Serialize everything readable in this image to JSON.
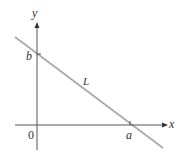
{
  "diagram": {
    "type": "coordinate-plane-line",
    "axes": {
      "x_label": "x",
      "y_label": "y",
      "origin_label": "0"
    },
    "line": {
      "label": "L",
      "x_intercept_label": "a",
      "y_intercept_label": "b",
      "color": "#a8a8a8"
    },
    "colors": {
      "axis": "#333333",
      "text": "#333333",
      "background": "#ffffff"
    }
  }
}
